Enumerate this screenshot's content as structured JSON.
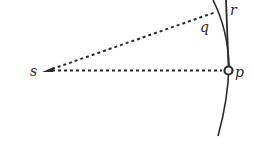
{
  "diagram": {
    "type": "geometric-optics-wavefront",
    "labels": {
      "s": "s",
      "p": "p",
      "q": "q",
      "r": "r"
    },
    "elements": [
      {
        "id": "source",
        "label": "s",
        "kind": "point-with-arrowhead"
      },
      {
        "id": "point-p",
        "label": "p",
        "kind": "hollow-circle"
      },
      {
        "id": "line-sp",
        "from": "s",
        "to": "p",
        "style": "dashed"
      },
      {
        "id": "line-sr",
        "from": "s",
        "to": "r",
        "style": "dashed"
      },
      {
        "id": "curve",
        "kind": "arc",
        "passes_through": [
          "q",
          "p"
        ]
      },
      {
        "id": "tangent-line",
        "kind": "straight-line",
        "passes_through": [
          "r",
          "p"
        ]
      }
    ],
    "colors": {
      "stroke": "#2a2a2a",
      "background": "#ffffff"
    }
  }
}
